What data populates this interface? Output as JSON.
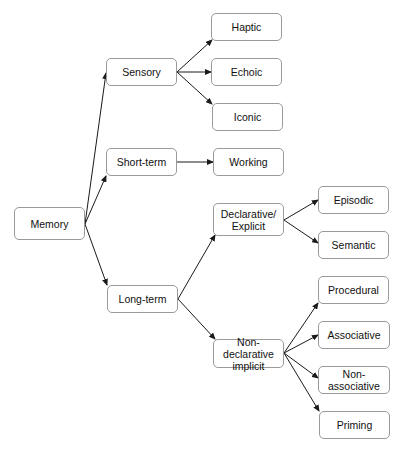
{
  "diagram": {
    "type": "tree",
    "root": "Memory",
    "nodes": {
      "memory": {
        "label": "Memory",
        "x": 14,
        "y": 207,
        "w": 71,
        "h": 33
      },
      "sensory": {
        "label": "Sensory",
        "x": 106,
        "y": 58,
        "w": 71,
        "h": 28
      },
      "short_term": {
        "label": "Short-term",
        "x": 106,
        "y": 148,
        "w": 71,
        "h": 28
      },
      "long_term": {
        "label": "Long-term",
        "x": 107,
        "y": 285,
        "w": 71,
        "h": 28
      },
      "haptic": {
        "label": "Haptic",
        "x": 211,
        "y": 13,
        "w": 71,
        "h": 28
      },
      "echoic": {
        "label": "Echoic",
        "x": 211,
        "y": 58,
        "w": 71,
        "h": 28
      },
      "iconic": {
        "label": "Iconic",
        "x": 212,
        "y": 103,
        "w": 71,
        "h": 28
      },
      "working": {
        "label": "Working",
        "x": 213,
        "y": 148,
        "w": 71,
        "h": 28
      },
      "declarative": {
        "label": "Declarative/ Explicit",
        "x": 213,
        "y": 203,
        "w": 71,
        "h": 33
      },
      "episodic": {
        "label": "Episodic",
        "x": 318,
        "y": 186,
        "w": 71,
        "h": 28
      },
      "semantic": {
        "label": "Semantic",
        "x": 318,
        "y": 231,
        "w": 71,
        "h": 28
      },
      "non_declarative": {
        "label": "Non-declarative implicit",
        "x": 213,
        "y": 339,
        "w": 71,
        "h": 29
      },
      "procedural": {
        "label": "Procedural",
        "x": 318,
        "y": 276,
        "w": 71,
        "h": 28
      },
      "associative": {
        "label": "Associative",
        "x": 318,
        "y": 321,
        "w": 72,
        "h": 28
      },
      "non_associative": {
        "label": "Non-associative",
        "x": 318,
        "y": 366,
        "w": 72,
        "h": 28
      },
      "priming": {
        "label": "Priming",
        "x": 319,
        "y": 411,
        "w": 71,
        "h": 28
      }
    },
    "edges": [
      {
        "from": "memory",
        "to": "sensory",
        "x1": 85,
        "y1": 224,
        "x2": 106,
        "y2": 73
      },
      {
        "from": "memory",
        "to": "short_term",
        "x1": 85,
        "y1": 224,
        "x2": 106,
        "y2": 176
      },
      {
        "from": "memory",
        "to": "long_term",
        "x1": 85,
        "y1": 224,
        "x2": 107,
        "y2": 285
      },
      {
        "from": "sensory",
        "to": "haptic",
        "x1": 177,
        "y1": 72,
        "x2": 212,
        "y2": 40
      },
      {
        "from": "sensory",
        "to": "echoic",
        "x1": 177,
        "y1": 72,
        "x2": 211,
        "y2": 72
      },
      {
        "from": "sensory",
        "to": "iconic",
        "x1": 177,
        "y1": 72,
        "x2": 212,
        "y2": 104
      },
      {
        "from": "short_term",
        "to": "working",
        "x1": 177,
        "y1": 162,
        "x2": 213,
        "y2": 162
      },
      {
        "from": "long_term",
        "to": "declarative",
        "x1": 178,
        "y1": 299,
        "x2": 215,
        "y2": 235
      },
      {
        "from": "long_term",
        "to": "non_declarative",
        "x1": 178,
        "y1": 299,
        "x2": 215,
        "y2": 339
      },
      {
        "from": "declarative",
        "to": "episodic",
        "x1": 284,
        "y1": 220,
        "x2": 318,
        "y2": 200
      },
      {
        "from": "declarative",
        "to": "semantic",
        "x1": 284,
        "y1": 220,
        "x2": 318,
        "y2": 243
      },
      {
        "from": "non_declarative",
        "to": "procedural",
        "x1": 284,
        "y1": 353,
        "x2": 318,
        "y2": 303
      },
      {
        "from": "non_declarative",
        "to": "associative",
        "x1": 284,
        "y1": 353,
        "x2": 318,
        "y2": 335
      },
      {
        "from": "non_declarative",
        "to": "non_associative",
        "x1": 284,
        "y1": 353,
        "x2": 318,
        "y2": 378
      },
      {
        "from": "non_declarative",
        "to": "priming",
        "x1": 284,
        "y1": 353,
        "x2": 319,
        "y2": 411
      }
    ],
    "colors": {
      "edge": "#1a1a1a",
      "node_border": "#9a9a9a",
      "text": "#111111"
    }
  }
}
